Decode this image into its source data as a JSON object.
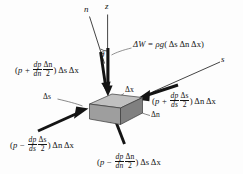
{
  "figure": {
    "name": "fluid-element-free-body-diagram",
    "background_color": "#fdfdfd",
    "ink_color": "#141414",
    "block": {
      "top_face_color": "#b9b9b9",
      "front_face_color": "#9a9a9a",
      "side_face_color": "#7d7d7d",
      "edge_color": "#3a3a3a"
    }
  },
  "axes": {
    "n_label": "n",
    "z_label": "z",
    "s_label": "s",
    "theta_label": "θ"
  },
  "weight": {
    "lhs": "ΔW",
    "equals": "=",
    "rho_g": "ρg",
    "open_paren": "(",
    "ds": "Δs",
    "dn": "Δn",
    "dx": "Δx",
    "close_paren": ")",
    "full_text": "ΔW = ρg( Δs Δn Δx )"
  },
  "dimensions": {
    "ds_label": "Δs",
    "dx_label": "Δx",
    "dn_label": "Δn"
  },
  "forces": {
    "top_left": {
      "name": "pressure-force-top-n-face",
      "open": "(",
      "p": "p",
      "sign": "+",
      "num": "dp",
      "den": "dn",
      "frac_num": "Δn",
      "frac_den": "2",
      "close": ")",
      "area_a": "Δs",
      "area_b": "Δx",
      "full_text": "(p + dp/dn · Δn/2) Δs Δx"
    },
    "right": {
      "name": "pressure-force-right-s-face",
      "open": "(",
      "p": "p",
      "sign": "+",
      "num": "dp",
      "den": "ds",
      "frac_num": "Δs",
      "frac_den": "2",
      "close": ")",
      "area_a": "Δn",
      "area_b": "Δx",
      "full_text": "(p + dp/ds · Δs/2) Δn Δx"
    },
    "bottom_left": {
      "name": "pressure-force-left-s-face",
      "open": "(",
      "p": "p",
      "sign": "−",
      "num": "dp",
      "den": "ds",
      "frac_num": "Δs",
      "frac_den": "2",
      "close": ")",
      "area_a": "Δn",
      "area_b": "Δx",
      "full_text": "(p − dp/ds · Δs/2) Δn Δx"
    },
    "bottom_right": {
      "name": "pressure-force-bottom-n-face",
      "open": "(",
      "p": "p",
      "sign": "−",
      "num": "dp",
      "den": "dn",
      "frac_num": "Δn",
      "frac_den": "2",
      "close": ")",
      "area_a": "Δs",
      "area_b": "Δx",
      "full_text": "(p − dp/dn · Δn/2) Δs Δx"
    }
  }
}
